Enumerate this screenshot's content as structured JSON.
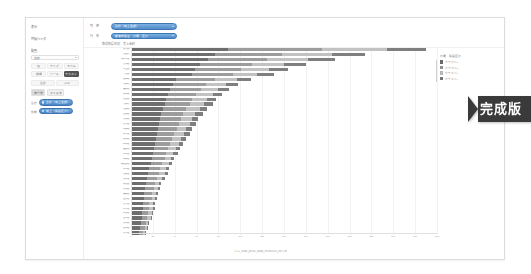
{
  "sidebar": {
    "sections": [
      {
        "label": "表示",
        "sub": ""
      },
      {
        "label": "列幅ヘッダ",
        "sub": ""
      },
      {
        "label": "配色",
        "sub": ""
      }
    ],
    "select": {
      "value": "自動",
      "caret": "chevron-down-icon"
    },
    "icon_cells": [
      "色",
      "サイズ",
      "ラベル",
      "詳細",
      "ツール",
      "テキスト"
    ],
    "icon_row2": [
      "合計",
      "パス"
    ],
    "tabs": [
      {
        "label": "マーク",
        "active": true
      },
      {
        "label": "フィルタ",
        "active": false
      }
    ],
    "pills": [
      {
        "prefix": "合計",
        "label": "合計（売上金額）"
      },
      {
        "prefix": "件数",
        "label": "売上（製品区分）"
      }
    ]
  },
  "topbar": {
    "filters": [
      {
        "label": "列　値",
        "value": "合計（売上金額）",
        "caret": "chevron-down-icon"
      },
      {
        "label": "行　名",
        "value": "都道府県名　分類　区分",
        "caret": "chevron-down-icon"
      }
    ]
  },
  "chart": {
    "title": "都道府県名別　売上金額",
    "caption": "1.1.1_trade_prices_tokyo_result2020_ver.1.tb"
  },
  "legend": {
    "title": "分類　製品区分",
    "items": [
      {
        "label": "カテゴリ1",
        "color": "#6e6e6e"
      },
      {
        "label": "カテゴリ2",
        "color": "#9c9c9c"
      },
      {
        "label": "カテゴリ3",
        "color": "#c2c2c2"
      },
      {
        "label": "カテゴリ4",
        "color": "#7f7f7f"
      }
    ]
  },
  "badge": {
    "label": "完成版"
  },
  "chart_data": {
    "type": "bar",
    "orientation": "horizontal",
    "stacked": true,
    "title": "都道府県名別　売上金額",
    "xlabel": "",
    "ylabel": "",
    "xlim": [
      0,
      280
    ],
    "grid": true,
    "legend_position": "right",
    "xticks": [
      0,
      20,
      40,
      60,
      80,
      100,
      120,
      140,
      160,
      180,
      200,
      220,
      240,
      260,
      280
    ],
    "categories": [
      "東京都",
      "大阪府",
      "神奈川県",
      "愛知県",
      "埼玉県",
      "千葉県",
      "兵庫県",
      "北海道",
      "福岡県",
      "静岡県",
      "広島県",
      "京都府",
      "茨城県",
      "宮城県",
      "新潟県",
      "長野県",
      "岐阜県",
      "栃木県",
      "群馬県",
      "岡山県",
      "福島県",
      "三重県",
      "熊本県",
      "鹿児島県",
      "山口県",
      "愛媛県",
      "長崎県",
      "滋賀県",
      "奈良県",
      "青森県",
      "岩手県",
      "大分県",
      "石川県",
      "山形県",
      "宮崎県",
      "富山県",
      "秋田県",
      "香川県"
    ],
    "series": [
      {
        "name": "カテゴリ1",
        "color": "#6e6e6e",
        "values": [
          88,
          76,
          70,
          62,
          58,
          55,
          40,
          38,
          35,
          33,
          31,
          30,
          28,
          27,
          26,
          25,
          24,
          23,
          22,
          21,
          20,
          19,
          18,
          17,
          16,
          15,
          14,
          13,
          12,
          11,
          11,
          10,
          10,
          9,
          9,
          8,
          7,
          6
        ]
      },
      {
        "name": "カテゴリ2",
        "color": "#9c9c9c",
        "values": [
          86,
          62,
          54,
          48,
          42,
          38,
          36,
          30,
          28,
          26,
          24,
          23,
          22,
          20,
          19,
          18,
          17,
          16,
          15,
          14,
          13,
          12,
          12,
          11,
          10,
          10,
          9,
          8,
          8,
          7,
          7,
          6,
          6,
          6,
          5,
          5,
          5,
          4
        ]
      },
      {
        "name": "カテゴリ3",
        "color": "#c2c2c2",
        "values": [
          60,
          46,
          38,
          30,
          26,
          22,
          20,
          18,
          16,
          15,
          14,
          13,
          12,
          11,
          10,
          10,
          9,
          9,
          8,
          8,
          7,
          7,
          6,
          6,
          5,
          5,
          5,
          4,
          4,
          4,
          3,
          3,
          3,
          3,
          3,
          2,
          2,
          2
        ]
      },
      {
        "name": "カテゴリ4",
        "color": "#7f7f7f",
        "values": [
          36,
          30,
          24,
          20,
          17,
          15,
          13,
          11,
          10,
          9,
          8,
          8,
          7,
          7,
          6,
          6,
          5,
          5,
          5,
          4,
          4,
          4,
          3,
          3,
          3,
          3,
          2,
          2,
          2,
          2,
          2,
          2,
          2,
          1,
          1,
          1,
          1,
          1
        ]
      }
    ]
  }
}
